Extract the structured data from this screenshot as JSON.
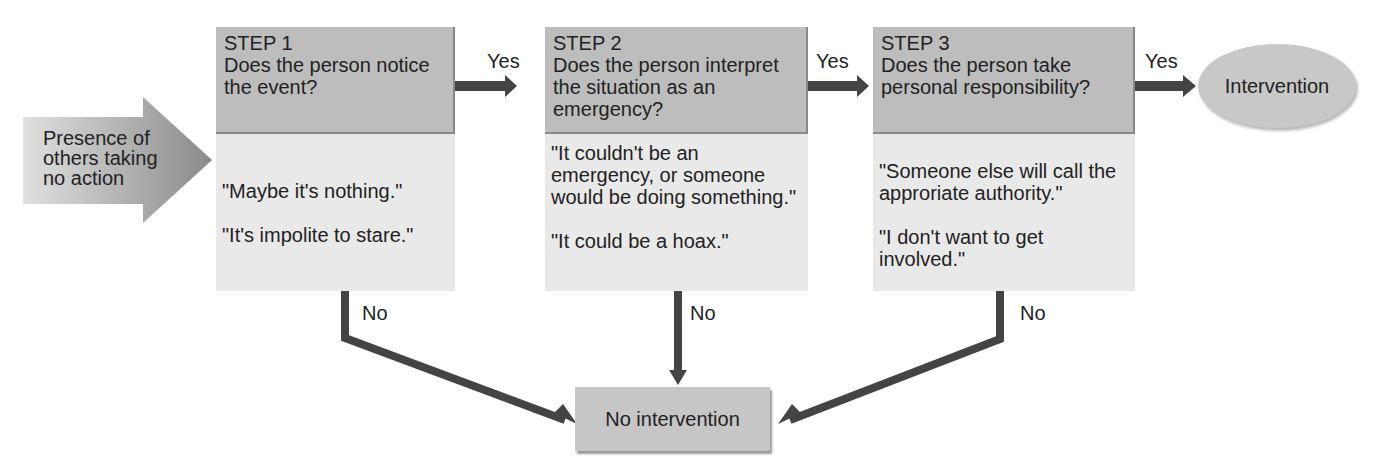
{
  "input": {
    "label_lines": [
      "Presence of",
      "others taking",
      "no action"
    ]
  },
  "steps": [
    {
      "title": "STEP 1",
      "question": "Does the person notice the event?",
      "excuses": [
        "\"Maybe it's nothing.\"",
        "\"It's impolite to stare.\""
      ]
    },
    {
      "title": "STEP 2",
      "question": "Does the person interpret the situation as an emergency?",
      "excuses": [
        "\"It couldn't be an emergency, or someone would be doing something.\"",
        "\"It could be a hoax.\""
      ]
    },
    {
      "title": "STEP 3",
      "question": "Does the person take personal responsibility?",
      "excuses": [
        "\"Someone else will call the approriate authority.\"",
        "\"I don't want to get involved.\""
      ]
    }
  ],
  "labels": {
    "yes": "Yes",
    "no": "No"
  },
  "outcomes": {
    "positive": "Intervention",
    "negative": "No intervention"
  }
}
